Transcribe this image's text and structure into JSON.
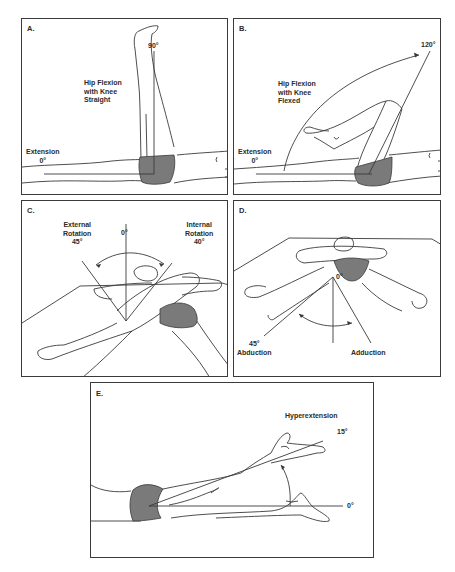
{
  "figure": {
    "panels": [
      {
        "id": "A",
        "label": "A.",
        "title": "Hip Flexion\nwith Knee\nStraight",
        "start_label": "Extension\n0°",
        "end_angle": "90°"
      },
      {
        "id": "B",
        "label": "B.",
        "title": "Hip Flexion\nwith Knee\nFlexed",
        "start_label": "Extension\n0°",
        "end_angle": "120°"
      },
      {
        "id": "C",
        "label": "C.",
        "left_label": "External\nRotation\n45°",
        "center_label": "0°",
        "right_label": "Internal\nRotation\n40°"
      },
      {
        "id": "D",
        "label": "D.",
        "center_label": "0°",
        "left_angle": "45°",
        "left_label": "Abduction",
        "right_label": "Adduction"
      },
      {
        "id": "E",
        "label": "E.",
        "title": "Hyperextension",
        "end_angle": "15°",
        "start_angle": "0°"
      }
    ],
    "colors": {
      "line": "#3a3a3a",
      "shorts_fill": "#7a7a7a",
      "background": "#ffffff"
    }
  }
}
